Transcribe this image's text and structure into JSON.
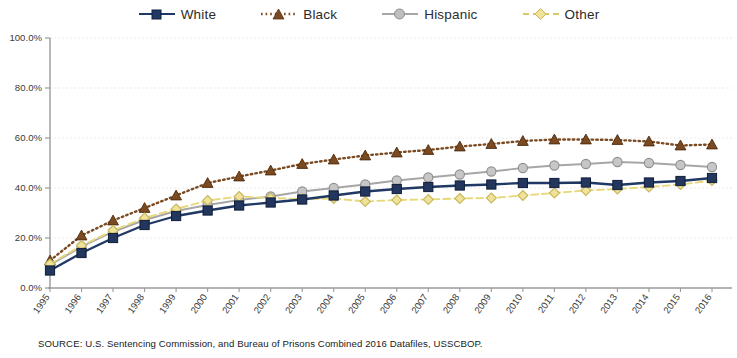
{
  "chart_data": {
    "type": "line",
    "title": "",
    "subtitle": "",
    "xlabel": "",
    "ylabel": "",
    "ylim": [
      0,
      100
    ],
    "yticks": [
      "0.0%",
      "20.0%",
      "40.0%",
      "60.0%",
      "80.0%",
      "100.0%"
    ],
    "ytick_values": [
      0,
      20,
      40,
      60,
      80,
      100
    ],
    "grid": true,
    "legend_position": "top",
    "x": [
      1995,
      1996,
      1997,
      1998,
      1999,
      2000,
      2001,
      2002,
      2003,
      2004,
      2005,
      2006,
      2007,
      2008,
      2009,
      2010,
      2011,
      2012,
      2013,
      2014,
      2015,
      2016
    ],
    "categories": [
      "1995",
      "1996",
      "1997",
      "1998",
      "1999",
      "2000",
      "2001",
      "2002",
      "2003",
      "2004",
      "2005",
      "2006",
      "2007",
      "2008",
      "2009",
      "2010",
      "2011",
      "2012",
      "2013",
      "2014",
      "2015",
      "2016"
    ],
    "series": [
      {
        "name": "White",
        "color": "#1F3864",
        "marker": "square",
        "line_style": "solid",
        "values": [
          7.0,
          14.0,
          20.0,
          25.2,
          28.8,
          31.0,
          33.0,
          34.2,
          35.4,
          37.0,
          38.6,
          39.6,
          40.4,
          41.0,
          41.4,
          42.0,
          42.0,
          42.2,
          41.2,
          42.2,
          42.8,
          44.0
        ]
      },
      {
        "name": "Black",
        "color": "#7B4A20",
        "marker": "triangle",
        "line_style": "dotted",
        "values": [
          11.0,
          21.0,
          27.0,
          32.0,
          37.0,
          42.0,
          44.6,
          47.0,
          49.6,
          51.4,
          53.0,
          54.2,
          55.2,
          56.6,
          57.6,
          58.8,
          59.4,
          59.4,
          59.2,
          58.6,
          57.0,
          57.4
        ]
      },
      {
        "name": "Hispanic",
        "color": "#A6A6A6",
        "marker": "circle",
        "line_style": "solid",
        "values": [
          9.2,
          16.5,
          22.5,
          27.2,
          30.8,
          33.2,
          35.2,
          36.6,
          38.6,
          40.0,
          41.4,
          43.0,
          44.2,
          45.4,
          46.6,
          48.0,
          49.0,
          49.6,
          50.4,
          50.0,
          49.2,
          48.4
        ]
      },
      {
        "name": "Other",
        "color": "#E8D87C",
        "marker": "diamond",
        "line_style": "dashed",
        "values": [
          9.6,
          17.0,
          23.0,
          28.0,
          31.6,
          35.0,
          36.6,
          36.0,
          35.6,
          35.8,
          34.6,
          35.2,
          35.4,
          35.8,
          36.0,
          37.0,
          38.0,
          39.0,
          39.6,
          40.4,
          41.4,
          43.0
        ]
      }
    ]
  },
  "legend": {
    "items": [
      {
        "label": "White",
        "key": "White"
      },
      {
        "label": "Black",
        "key": "Black"
      },
      {
        "label": "Hispanic",
        "key": "Hispanic"
      },
      {
        "label": "Other",
        "key": "Other"
      }
    ]
  },
  "footer": {
    "source": "SOURCE:  U.S. Sentencing Commission, and Bureau of Prisons Combined 2016 Datafiles, USSCBOP."
  }
}
